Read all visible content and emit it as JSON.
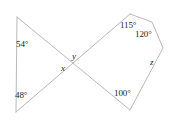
{
  "figure": {
    "stroke_color": "#b9b9bd",
    "text_color": "#231f20",
    "background_color": "#ffffff",
    "labels": {
      "angle_54": "54°",
      "angle_48": "48°",
      "angle_115": "115°",
      "angle_120": "120°",
      "angle_100": "100°",
      "var_x": "x",
      "var_y": "y",
      "var_z": "z"
    },
    "geometry": {
      "intersection": [
        75,
        65
      ],
      "triangle_top_left": [
        17,
        17
      ],
      "triangle_bottom_left": [
        16,
        112
      ],
      "pentagon_apex": [
        130,
        14
      ],
      "pentagon_upper_right": [
        152,
        22
      ],
      "pentagon_right": [
        163,
        48
      ],
      "pentagon_bottom": [
        130,
        110
      ],
      "polylines": [
        {
          "name": "left-upper-edge",
          "points": "17,17 16,112"
        },
        {
          "name": "upper-crossing-line",
          "points": "17,17 130,110"
        },
        {
          "name": "lower-crossing-line",
          "points": "16,112 130,14"
        },
        {
          "name": "pentagon-right-chain",
          "points": "130,14 152,22 163,48 130,110"
        }
      ]
    }
  }
}
